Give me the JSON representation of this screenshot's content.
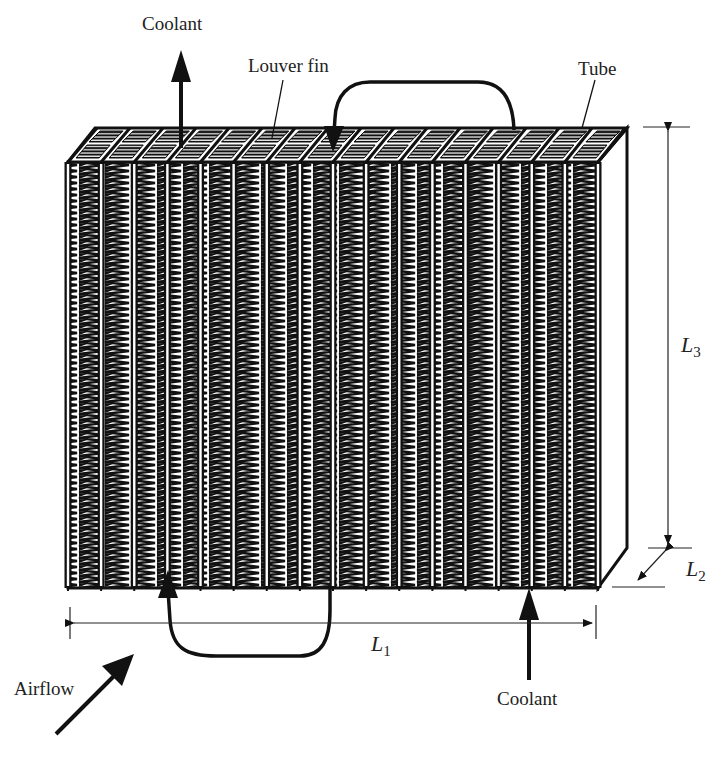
{
  "diagram": {
    "colors": {
      "ink": "#111111",
      "text": "#222222",
      "background": "#ffffff"
    },
    "tube_count": 16,
    "labels": {
      "coolant_out": "Coolant",
      "coolant_in": "Coolant",
      "louver_fin": "Louver fin",
      "tube": "Tube",
      "airflow": "Airflow"
    },
    "dimensions": {
      "L1": {
        "symbol": "L",
        "subscript": "1"
      },
      "L2": {
        "symbol": "L",
        "subscript": "2"
      },
      "L3": {
        "symbol": "L",
        "subscript": "3"
      }
    }
  }
}
